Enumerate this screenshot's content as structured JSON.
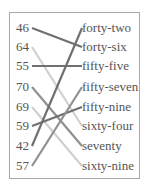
{
  "left_items": [
    "46",
    "64",
    "55",
    "70",
    "69",
    "59",
    "42",
    "57"
  ],
  "right_items": [
    "forty-two",
    "forty-six",
    "fifty-five",
    "fifty-seven",
    "fifty-nine",
    "sixty-four",
    "seventy",
    "sixty-nine"
  ],
  "connections": [
    {
      "from": 0,
      "to": 1,
      "color": "#707070"
    },
    {
      "from": 1,
      "to": 5,
      "color": "#d0d0d0"
    },
    {
      "from": 2,
      "to": 2,
      "color": "#707070"
    },
    {
      "from": 3,
      "to": 6,
      "color": "#909090"
    },
    {
      "from": 4,
      "to": 7,
      "color": "#d0d0d0"
    },
    {
      "from": 5,
      "to": 4,
      "color": "#707070"
    },
    {
      "from": 6,
      "to": 0,
      "color": "#707070"
    },
    {
      "from": 7,
      "to": 3,
      "color": "#909090"
    }
  ]
}
